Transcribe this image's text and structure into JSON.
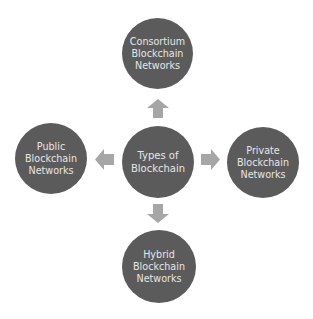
{
  "diagram": {
    "center": {
      "label": "Types of\nBlockchain"
    },
    "nodes": {
      "top": {
        "label": "Consortium\nBlockchain\nNetworks"
      },
      "left": {
        "label": "Public\nBlockchain\nNetworks"
      },
      "right": {
        "label": "Private\nBlockchain\nNetworks"
      },
      "bottom": {
        "label": "Hybrid\nBlockchain\nNetworks"
      }
    },
    "colors": {
      "circle": "#5b5b5b",
      "arrow": "#a6a6a6",
      "text": "#e6e6e6",
      "background": "#ffffff"
    },
    "edges": [
      {
        "from": "center",
        "to": "top",
        "direction": "up"
      },
      {
        "from": "center",
        "to": "left",
        "direction": "left"
      },
      {
        "from": "center",
        "to": "right",
        "direction": "right"
      },
      {
        "from": "center",
        "to": "bottom",
        "direction": "down"
      }
    ]
  }
}
